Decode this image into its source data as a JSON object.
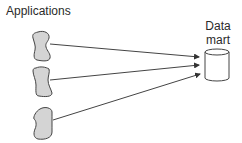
{
  "diagram": {
    "sources_label": "Applications",
    "target_label_line1": "Data",
    "target_label_line2": "mart",
    "sources": [
      {
        "name": "application-1"
      },
      {
        "name": "application-2"
      },
      {
        "name": "application-3"
      }
    ],
    "target": {
      "name": "data-mart",
      "shape": "cylinder"
    },
    "colors": {
      "shape_fill": "#d4d4d4",
      "stroke": "#444444",
      "text": "#2a2a2a",
      "background": "#ffffff"
    }
  }
}
